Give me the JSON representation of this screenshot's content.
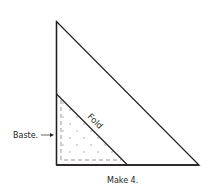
{
  "diagram": {
    "labels": {
      "fold": "Fold",
      "baste": "Baste.",
      "caption": "Make 4."
    },
    "colors": {
      "stroke": "#231f20",
      "dots": "#9a9a9a",
      "dash": "#8a8a8a",
      "background": "#ffffff"
    },
    "shapes": {
      "outer_triangle": "right triangle, right angle bottom-left",
      "inner_folded_triangle": "small right triangle, dotted fill, dashed baste line inside"
    }
  }
}
